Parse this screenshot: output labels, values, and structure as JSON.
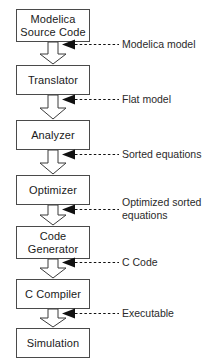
{
  "diagram": {
    "type": "flowchart",
    "orientation": "vertical",
    "colors": {
      "box_border": "#4a4a4a",
      "box_fill": "#ffffff",
      "flow_arrow_fill": "#ffffff",
      "flow_arrow_stroke": "#3a3a3a",
      "dashed_arrow": "#1a1a1a",
      "text": "#1a1a1a",
      "background": "#ffffff"
    },
    "stages": [
      {
        "id": "modelica-source-code",
        "label": "Modelica\nSource Code",
        "x": 16,
        "y": 9,
        "w": 74,
        "h": 33
      },
      {
        "id": "translator",
        "label": "Translator",
        "x": 16,
        "y": 65,
        "w": 74,
        "h": 30
      },
      {
        "id": "analyzer",
        "label": "Analyzer",
        "x": 16,
        "y": 120,
        "w": 74,
        "h": 30
      },
      {
        "id": "optimizer",
        "label": "Optimizer",
        "x": 16,
        "y": 175,
        "w": 74,
        "h": 30
      },
      {
        "id": "code-generator",
        "label": "Code\nGenerator",
        "x": 16,
        "y": 226,
        "w": 74,
        "h": 33
      },
      {
        "id": "c-compiler",
        "label": "C Compiler",
        "x": 16,
        "y": 279,
        "w": 74,
        "h": 30
      },
      {
        "id": "simulation",
        "label": "Simulation",
        "x": 16,
        "y": 328,
        "w": 74,
        "h": 30
      }
    ],
    "flow_arrows": [
      {
        "id": "flow-source-to-translator",
        "from": "modelica-source-code",
        "to": "translator",
        "x": 39,
        "y": 42,
        "w": 28,
        "h": 23
      },
      {
        "id": "flow-translator-to-analyzer",
        "from": "translator",
        "to": "analyzer",
        "x": 39,
        "y": 95,
        "w": 28,
        "h": 25
      },
      {
        "id": "flow-analyzer-to-optimizer",
        "from": "analyzer",
        "to": "optimizer",
        "x": 39,
        "y": 150,
        "w": 28,
        "h": 25
      },
      {
        "id": "flow-optimizer-to-codegen",
        "from": "optimizer",
        "to": "code-generator",
        "x": 39,
        "y": 205,
        "w": 28,
        "h": 21
      },
      {
        "id": "flow-codegen-to-compiler",
        "from": "code-generator",
        "to": "c-compiler",
        "x": 39,
        "y": 259,
        "w": 28,
        "h": 20
      },
      {
        "id": "flow-compiler-to-simulation",
        "from": "c-compiler",
        "to": "simulation",
        "x": 39,
        "y": 309,
        "w": 28,
        "h": 19
      }
    ],
    "annotations": [
      {
        "id": "modelica-model",
        "label": "Modelica  model",
        "arrow_x": 62,
        "arrow_y": 44,
        "arrow_w": 56,
        "label_x": 122,
        "label_y": 42
      },
      {
        "id": "flat-model",
        "label": "Flat model",
        "arrow_x": 62,
        "arrow_y": 99,
        "arrow_w": 56,
        "label_x": 122,
        "label_y": 97
      },
      {
        "id": "sorted-equations",
        "label": "Sorted  equations",
        "arrow_x": 62,
        "arrow_y": 154,
        "arrow_w": 56,
        "label_x": 122,
        "label_y": 152
      },
      {
        "id": "optimized-sorted-equations",
        "label": "Optimized  sorted\nequations",
        "arrow_x": 62,
        "arrow_y": 209,
        "arrow_w": 56,
        "label_x": 122,
        "label_y": 195
      },
      {
        "id": "c-code",
        "label": "C Code",
        "arrow_x": 62,
        "arrow_y": 262,
        "arrow_w": 56,
        "label_x": 122,
        "label_y": 256
      },
      {
        "id": "executable",
        "label": "Executable",
        "arrow_x": 62,
        "arrow_y": 313,
        "arrow_w": 56,
        "label_x": 122,
        "label_y": 306
      }
    ]
  }
}
